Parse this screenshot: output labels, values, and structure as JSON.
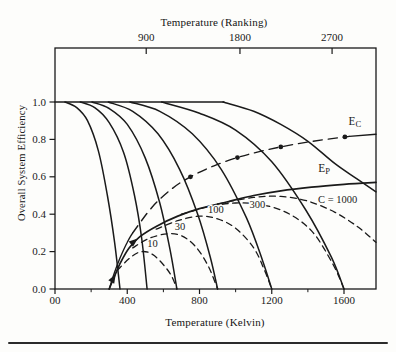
{
  "figure": {
    "ink_color": "#1a1a1a",
    "background": "#fdfdfb",
    "top_axis": {
      "title": "Temperature (Ranking)"
    },
    "bottom_axis": {
      "title": "Temperature (Kelvin)"
    },
    "y_axis": {
      "title": "Overall System Efficiency"
    }
  },
  "chart_data": {
    "type": "line",
    "title": "",
    "xlabel": "Temperature (Kelvin)",
    "x2label": "Temperature (Ranking)",
    "ylabel": "Overall System Efficiency",
    "xlim": [
      0,
      1777
    ],
    "ylim": [
      0,
      1.29
    ],
    "grid": false,
    "x_ticks": {
      "values": [
        0,
        400,
        800,
        1200,
        1600
      ],
      "labels": [
        "00",
        "400",
        "800",
        "1200",
        "1600"
      ],
      "minor_values": [
        200,
        600,
        1000,
        1400
      ]
    },
    "x2_ticks": {
      "values_kelvin": [
        505,
        1024,
        1534
      ],
      "labels": [
        "900",
        "1800",
        "2700"
      ]
    },
    "y_ticks": {
      "values": [
        1.0,
        0.8,
        0.6,
        0.4,
        0.2,
        0.0
      ],
      "labels": [
        "1.0",
        "0.8",
        "0.6",
        "0.4",
        "0.2",
        "0.0"
      ]
    },
    "series": [
      {
        "name": "efficiency-one-baseline",
        "role": "reference",
        "linestyle": "solid",
        "width": 1.5,
        "points": [
          [
            0,
            1.0
          ],
          [
            935,
            1.0
          ]
        ]
      },
      {
        "name": "collector-C1",
        "role": "collector-efficiency",
        "C": 1,
        "linestyle": "solid",
        "width": 1.5,
        "points": [
          [
            55,
            1.0
          ],
          [
            120,
            0.97
          ],
          [
            180,
            0.9
          ],
          [
            240,
            0.74
          ],
          [
            290,
            0.5
          ],
          [
            330,
            0.25
          ],
          [
            360,
            0
          ]
        ]
      },
      {
        "name": "collector-C3",
        "role": "collector-efficiency",
        "C": 3,
        "linestyle": "solid",
        "width": 1.5,
        "points": [
          [
            140,
            1.0
          ],
          [
            220,
            0.97
          ],
          [
            300,
            0.89
          ],
          [
            380,
            0.73
          ],
          [
            440,
            0.5
          ],
          [
            480,
            0.27
          ],
          [
            510,
            0
          ]
        ]
      },
      {
        "name": "collector-C10",
        "role": "collector-efficiency",
        "C": 10,
        "linestyle": "solid",
        "width": 1.5,
        "points": [
          [
            205,
            1.0
          ],
          [
            300,
            0.965
          ],
          [
            400,
            0.88
          ],
          [
            500,
            0.7
          ],
          [
            580,
            0.46
          ],
          [
            635,
            0.22
          ],
          [
            675,
            0
          ]
        ]
      },
      {
        "name": "collector-C30",
        "role": "collector-efficiency",
        "C": 30,
        "linestyle": "solid",
        "width": 1.5,
        "points": [
          [
            295,
            1.0
          ],
          [
            430,
            0.95
          ],
          [
            570,
            0.83
          ],
          [
            690,
            0.64
          ],
          [
            790,
            0.4
          ],
          [
            860,
            0.17
          ],
          [
            900,
            0
          ]
        ]
      },
      {
        "name": "collector-C100",
        "role": "collector-efficiency",
        "C": 100,
        "linestyle": "solid",
        "width": 1.5,
        "points": [
          [
            415,
            1.0
          ],
          [
            580,
            0.95
          ],
          [
            760,
            0.83
          ],
          [
            920,
            0.64
          ],
          [
            1060,
            0.38
          ],
          [
            1150,
            0.15
          ],
          [
            1200,
            0
          ]
        ]
      },
      {
        "name": "collector-C300",
        "role": "collector-efficiency",
        "C": 300,
        "linestyle": "solid",
        "width": 1.5,
        "points": [
          [
            590,
            1.0
          ],
          [
            800,
            0.94
          ],
          [
            1000,
            0.85
          ],
          [
            1200,
            0.68
          ],
          [
            1390,
            0.42
          ],
          [
            1530,
            0.17
          ],
          [
            1600,
            0
          ]
        ]
      },
      {
        "name": "collector-C1000",
        "role": "collector-efficiency",
        "C": 1000,
        "linestyle": "solid",
        "width": 1.5,
        "points": [
          [
            930,
            1.0
          ],
          [
            1100,
            0.95
          ],
          [
            1250,
            0.88
          ],
          [
            1400,
            0.79
          ],
          [
            1550,
            0.67
          ],
          [
            1670,
            0.59
          ],
          [
            1777,
            0.52
          ]
        ]
      },
      {
        "name": "overall-C10",
        "role": "overall-efficiency",
        "C": 10,
        "linestyle": "dashed",
        "width": 1.3,
        "points": [
          [
            345,
            0.1
          ],
          [
            420,
            0.17
          ],
          [
            480,
            0.2
          ],
          [
            540,
            0.185
          ],
          [
            600,
            0.13
          ],
          [
            645,
            0.07
          ],
          [
            675,
            0
          ]
        ]
      },
      {
        "name": "overall-C30",
        "role": "overall-efficiency",
        "C": 30,
        "linestyle": "dashed",
        "width": 1.3,
        "points": [
          [
            430,
            0.22
          ],
          [
            520,
            0.27
          ],
          [
            620,
            0.295
          ],
          [
            700,
            0.285
          ],
          [
            780,
            0.225
          ],
          [
            850,
            0.12
          ],
          [
            900,
            0
          ]
        ]
      },
      {
        "name": "overall-C100",
        "role": "overall-efficiency",
        "C": 100,
        "linestyle": "dashed",
        "width": 1.3,
        "points": [
          [
            560,
            0.32
          ],
          [
            680,
            0.365
          ],
          [
            800,
            0.39
          ],
          [
            900,
            0.375
          ],
          [
            1000,
            0.325
          ],
          [
            1100,
            0.22
          ],
          [
            1160,
            0.1
          ],
          [
            1200,
            0
          ]
        ]
      },
      {
        "name": "overall-C300",
        "role": "overall-efficiency",
        "C": 300,
        "linestyle": "dashed",
        "width": 1.3,
        "points": [
          [
            700,
            0.4
          ],
          [
            850,
            0.44
          ],
          [
            1000,
            0.46
          ],
          [
            1150,
            0.45
          ],
          [
            1300,
            0.4
          ],
          [
            1430,
            0.3
          ],
          [
            1540,
            0.13
          ],
          [
            1600,
            0
          ]
        ]
      },
      {
        "name": "overall-C1000",
        "role": "overall-efficiency",
        "C": 1000,
        "linestyle": "dashed",
        "width": 1.3,
        "points": [
          [
            900,
            0.455
          ],
          [
            1100,
            0.49
          ],
          [
            1250,
            0.495
          ],
          [
            1400,
            0.47
          ],
          [
            1550,
            0.41
          ],
          [
            1680,
            0.33
          ],
          [
            1777,
            0.25
          ]
        ]
      },
      {
        "name": "engine-efficiency-EP",
        "role": "practical-engine-efficiency",
        "linestyle": "solid",
        "width": 1.7,
        "points": [
          [
            300,
            0
          ],
          [
            330,
            0.07
          ],
          [
            365,
            0.145
          ],
          [
            410,
            0.22
          ],
          [
            470,
            0.28
          ],
          [
            560,
            0.335
          ],
          [
            680,
            0.39
          ],
          [
            800,
            0.43
          ],
          [
            950,
            0.465
          ],
          [
            1100,
            0.5
          ],
          [
            1250,
            0.525
          ],
          [
            1420,
            0.545
          ],
          [
            1600,
            0.56
          ],
          [
            1777,
            0.57
          ]
        ]
      },
      {
        "name": "carnot-efficiency-EC-lower",
        "role": "carnot-efficiency",
        "linestyle": "solid",
        "width": 1.4,
        "points": [
          [
            300,
            0
          ],
          [
            310,
            0.03
          ],
          [
            330,
            0.09
          ],
          [
            360,
            0.165
          ],
          [
            400,
            0.25
          ],
          [
            430,
            0.3
          ]
        ]
      },
      {
        "name": "carnot-efficiency-EC-main",
        "role": "carnot-efficiency",
        "linestyle": "longdash",
        "width": 1.4,
        "points": [
          [
            430,
            0.3
          ],
          [
            540,
            0.44
          ],
          [
            650,
            0.538
          ],
          [
            750,
            0.6
          ],
          [
            880,
            0.659
          ],
          [
            1010,
            0.703
          ],
          [
            1120,
            0.732
          ],
          [
            1250,
            0.76
          ],
          [
            1420,
            0.789
          ],
          [
            1630,
            0.816
          ]
        ]
      },
      {
        "name": "carnot-efficiency-EC-end",
        "role": "carnot-efficiency",
        "linestyle": "solid",
        "width": 1.4,
        "points": [
          [
            1630,
            0.816
          ],
          [
            1777,
            0.828
          ]
        ]
      }
    ],
    "point_markers": {
      "series": "carnot-efficiency-EC",
      "points": [
        [
          750,
          0.6
        ],
        [
          1010,
          0.703
        ],
        [
          1250,
          0.76
        ],
        [
          1605,
          0.813
        ]
      ]
    },
    "annotations": [
      {
        "kind": "curve-label",
        "text": "10",
        "T": 540,
        "eff": 0.225
      },
      {
        "kind": "curve-label",
        "text": "30",
        "T": 692,
        "eff": 0.315
      },
      {
        "kind": "curve-label",
        "text": "100",
        "T": 890,
        "eff": 0.405
      },
      {
        "kind": "curve-label",
        "text": "300",
        "T": 1120,
        "eff": 0.435
      },
      {
        "kind": "curve-label",
        "text": "C = 1000",
        "T": 1565,
        "eff": 0.462
      },
      {
        "kind": "series-label",
        "text": "E",
        "sub": "C",
        "T": 1660,
        "eff": 0.878
      },
      {
        "kind": "series-label",
        "text": "E",
        "sub": "P",
        "T": 1490,
        "eff": 0.628
      },
      {
        "kind": "arrow",
        "T": 332,
        "eff": 0.072,
        "angle_deg": -60
      },
      {
        "kind": "arrow",
        "T": 452,
        "eff": 0.265,
        "angle_deg": -40
      }
    ]
  }
}
